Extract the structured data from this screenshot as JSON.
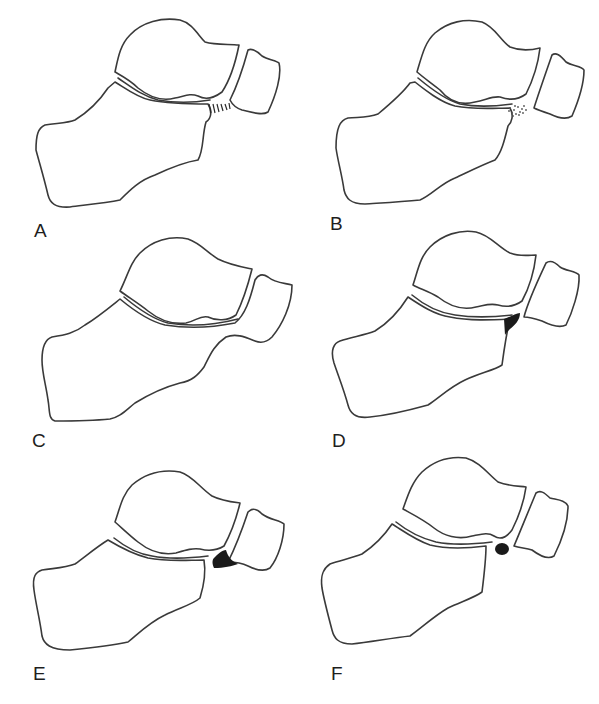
{
  "figure": {
    "panels": [
      {
        "id": "A",
        "label": "A",
        "variant": "fibrous coalition (hatched bridge between calcaneus and navicular)"
      },
      {
        "id": "B",
        "label": "B",
        "variant": "cartilaginous coalition (stippled bridge)"
      },
      {
        "id": "C",
        "label": "C",
        "variant": "osseous coalition (calcaneus fused with navicular)"
      },
      {
        "id": "D",
        "label": "D",
        "variant": "elongated anterior process of calcaneus (black wedge)"
      },
      {
        "id": "E",
        "label": "E",
        "variant": "process extending toward navicular (black fill)"
      },
      {
        "id": "F",
        "label": "F",
        "variant": "os calcaneus secundarius (black round ossicle)"
      }
    ],
    "colors": {
      "outline": "#3a3a3a",
      "fill_dark": "#1a1a1a",
      "background": "#ffffff"
    }
  }
}
